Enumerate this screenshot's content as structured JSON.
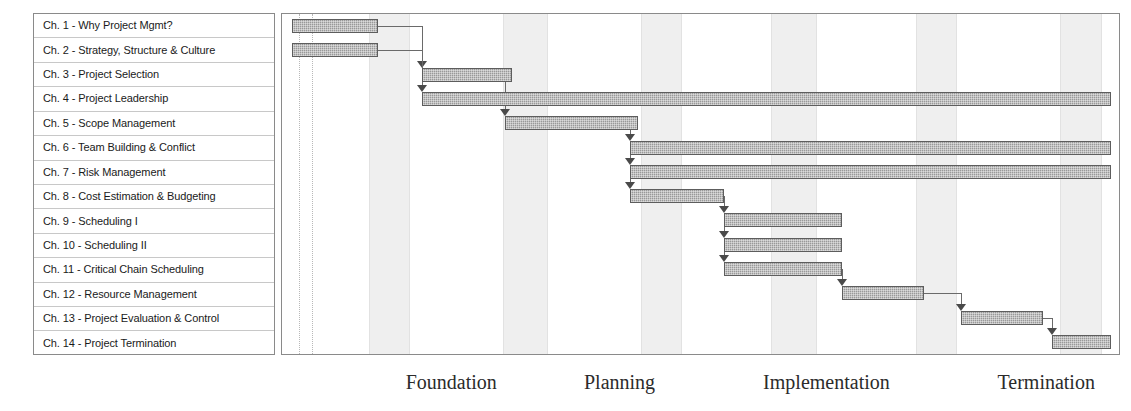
{
  "chart_data": {
    "type": "bar",
    "subtype": "gantt",
    "title": "",
    "xlabel": "",
    "ylabel": "",
    "grid": false,
    "legend": "none",
    "axis_note": "Horizontal time axis is unlabeled; phases are annotated beneath the chart",
    "categories": [
      "Ch. 1 - Why Project Mgmt?",
      "Ch. 2 - Strategy, Structure & Culture",
      "Ch. 3 - Project Selection",
      "Ch. 4 - Project Leadership",
      "Ch. 5 - Scope Management",
      "Ch. 6 - Team Building & Conflict",
      "Ch. 7 - Risk Management",
      "Ch. 8 - Cost Estimation & Budgeting",
      "Ch. 9 - Scheduling I",
      "Ch. 10 - Scheduling II",
      "Ch. 11 - Critical Chain Scheduling",
      "Ch. 12 - Resource Management",
      "Ch. 13 - Project Evaluation & Control",
      "Ch. 14 - Project Termination"
    ],
    "tasks": [
      {
        "row": 1,
        "label": "Ch. 1 - Why Project Mgmt?",
        "start": 1.2,
        "end": 11.5
      },
      {
        "row": 2,
        "label": "Ch. 2 - Strategy, Structure & Culture",
        "start": 1.2,
        "end": 11.5
      },
      {
        "row": 3,
        "label": "Ch. 3 - Project Selection",
        "start": 16.7,
        "end": 27.5
      },
      {
        "row": 4,
        "label": "Ch. 4 - Project Leadership",
        "start": 16.7,
        "end": 99.0
      },
      {
        "row": 5,
        "label": "Ch. 5 - Scope Management",
        "start": 26.7,
        "end": 42.5
      },
      {
        "row": 6,
        "label": "Ch. 6 - Team Building & Conflict",
        "start": 41.6,
        "end": 99.0
      },
      {
        "row": 7,
        "label": "Ch. 7 - Risk Management",
        "start": 41.6,
        "end": 99.0
      },
      {
        "row": 8,
        "label": "Ch. 8 - Cost Estimation & Budgeting",
        "start": 41.6,
        "end": 52.8
      },
      {
        "row": 9,
        "label": "Ch. 9 - Scheduling I",
        "start": 52.8,
        "end": 66.9
      },
      {
        "row": 10,
        "label": "Ch. 10 - Scheduling II",
        "start": 52.8,
        "end": 66.9
      },
      {
        "row": 11,
        "label": "Ch. 11 - Critical Chain Scheduling",
        "start": 52.8,
        "end": 66.9
      },
      {
        "row": 12,
        "label": "Ch. 12 - Resource Management",
        "start": 66.9,
        "end": 76.7
      },
      {
        "row": 13,
        "label": "Ch. 13 - Project Evaluation & Control",
        "start": 81.1,
        "end": 90.9
      },
      {
        "row": 14,
        "label": "Ch. 14 - Project Termination",
        "start": 92.0,
        "end": 99.0
      }
    ],
    "dependencies": [
      {
        "from": 1,
        "to": 3
      },
      {
        "from": 2,
        "to": 4
      },
      {
        "from": 3,
        "to": 5
      },
      {
        "from": 5,
        "to": 6
      },
      {
        "from": 6,
        "to": 7
      },
      {
        "from": 7,
        "to": 8
      },
      {
        "from": 8,
        "to": 9
      },
      {
        "from": 9,
        "to": 10
      },
      {
        "from": 10,
        "to": 11
      },
      {
        "from": 11,
        "to": 12
      },
      {
        "from": 12,
        "to": 13
      },
      {
        "from": 13,
        "to": 14
      }
    ],
    "phases": [
      {
        "name": "Foundation",
        "x_pct": 14.9
      },
      {
        "name": "Planning",
        "x_pct": 36.2
      },
      {
        "name": "Implementation",
        "x_pct": 57.6
      },
      {
        "name": "Termination",
        "x_pct": 85.6
      }
    ],
    "bands_pct": [
      {
        "start": 10.4,
        "end": 15.1
      },
      {
        "start": 26.4,
        "end": 31.5
      },
      {
        "start": 42.9,
        "end": 47.6
      },
      {
        "start": 58.4,
        "end": 63.7
      },
      {
        "start": 75.7,
        "end": 80.4
      },
      {
        "start": 93.0,
        "end": 97.7
      }
    ],
    "colors": {
      "bar_fill": "#999999",
      "bar_border": "#5d5d5d",
      "band": "#efefef",
      "panel_border": "#8a8a8a",
      "row_divider": "#c8c8c8",
      "link": "#6a6a6a",
      "text": "#1a1a1a",
      "phase_text": "#2b2b2b"
    }
  },
  "tasks_panel": {
    "rows": [
      {
        "label": "Ch. 1 - Why Project Mgmt?"
      },
      {
        "label": "Ch. 2 - Strategy, Structure & Culture"
      },
      {
        "label": "Ch. 3 - Project Selection"
      },
      {
        "label": "Ch. 4 - Project Leadership"
      },
      {
        "label": "Ch. 5 - Scope Management"
      },
      {
        "label": "Ch. 6 - Team Building & Conflict"
      },
      {
        "label": "Ch. 7 - Risk Management"
      },
      {
        "label": "Ch. 8 - Cost Estimation & Budgeting"
      },
      {
        "label": "Ch. 9 - Scheduling I"
      },
      {
        "label": "Ch. 10 - Scheduling II"
      },
      {
        "label": "Ch. 11 - Critical Chain Scheduling"
      },
      {
        "label": "Ch. 12 - Resource Management"
      },
      {
        "label": "Ch. 13 - Project Evaluation & Control"
      },
      {
        "label": "Ch. 14 - Project Termination"
      }
    ]
  },
  "phase_axis": {
    "labels": [
      {
        "text": "Foundation"
      },
      {
        "text": "Planning"
      },
      {
        "text": "Implementation"
      },
      {
        "text": "Termination"
      }
    ]
  }
}
